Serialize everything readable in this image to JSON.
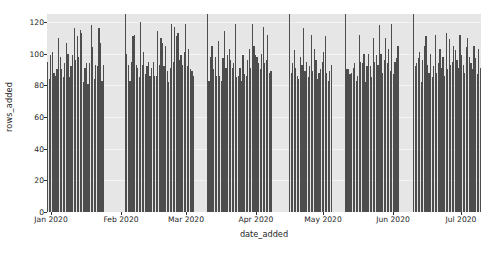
{
  "chart_data": {
    "type": "bar",
    "title": "",
    "xlabel": "date_added",
    "ylabel": "rows_added",
    "ylim": [
      0,
      125
    ],
    "yticks": [
      0,
      20,
      40,
      60,
      80,
      100,
      120
    ],
    "ytick_labels": [
      "0",
      "20",
      "40",
      "60",
      "80",
      "100",
      "120"
    ],
    "xtick_labels": [
      "Jan 2020",
      "Feb 2020",
      "Mar 2020",
      "Apr 2020",
      "May 2020",
      "Jun 2020",
      "Jul 2020"
    ],
    "xtick_positions_px": [
      51,
      121,
      186,
      256,
      323,
      393,
      461
    ],
    "grid": true,
    "grid_axis": "y",
    "bar_color": "#4d4d4d",
    "plot_background": "#e6e6e6",
    "figure_background": "#ffffff",
    "x_start": "2020-01-01",
    "x_end": "2020-07-28",
    "x_unit": "day",
    "note_clipped": "Several bars exceed the top of the axis and are clipped at 125.",
    "values": [
      95,
      84,
      99,
      101,
      88,
      86,
      90,
      110,
      98,
      90,
      85,
      94,
      107,
      100,
      85,
      92,
      99,
      116,
      96,
      111,
      98,
      115,
      113,
      82,
      91,
      94,
      81,
      94,
      118,
      104,
      84,
      93,
      92,
      116,
      107,
      83,
      93,
      null,
      null,
      null,
      null,
      null,
      null,
      null,
      null,
      null,
      null,
      null,
      null,
      null,
      126,
      100,
      93,
      83,
      95,
      111,
      112,
      93,
      91,
      85,
      120,
      93,
      101,
      87,
      92,
      95,
      86,
      91,
      95,
      86,
      86,
      114,
      93,
      110,
      107,
      92,
      105,
      89,
      82,
      91,
      119,
      95,
      117,
      111,
      113,
      96,
      99,
      93,
      101,
      119,
      92,
      103,
      90,
      89,
      86,
      null,
      null,
      null,
      null,
      null,
      null,
      null,
      null,
      126,
      83,
      98,
      105,
      90,
      98,
      86,
      108,
      86,
      83,
      97,
      114,
      91,
      99,
      103,
      96,
      91,
      94,
      119,
      85,
      86,
      91,
      83,
      99,
      87,
      86,
      96,
      103,
      91,
      119,
      105,
      99,
      98,
      94,
      90,
      100,
      117,
      94,
      96,
      112,
      88,
      89,
      null,
      null,
      null,
      null,
      null,
      null,
      null,
      null,
      null,
      null,
      null,
      126,
      88,
      94,
      102,
      91,
      86,
      84,
      98,
      93,
      116,
      89,
      95,
      85,
      92,
      112,
      89,
      103,
      96,
      84,
      88,
      90,
      95,
      101,
      111,
      88,
      83,
      89,
      93,
      null,
      null,
      null,
      null,
      null,
      null,
      null,
      null,
      126,
      90,
      90,
      87,
      88,
      91,
      94,
      83,
      86,
      112,
      95,
      94,
      100,
      82,
      92,
      100,
      92,
      85,
      110,
      95,
      99,
      93,
      118,
      100,
      88,
      96,
      110,
      94,
      103,
      89,
      119,
      87,
      95,
      97,
      105,
      null,
      null,
      null,
      null,
      null,
      null,
      null,
      null,
      null,
      126,
      92,
      94,
      97,
      101,
      82,
      96,
      105,
      111,
      93,
      88,
      100,
      85,
      92,
      112,
      88,
      94,
      103,
      91,
      98,
      86,
      113,
      90,
      109,
      93,
      95,
      105,
      102,
      96,
      91,
      112,
      99,
      93,
      88,
      104,
      110,
      98,
      94,
      90,
      105,
      97,
      87,
      103,
      91
    ]
  },
  "axes": {
    "ylabel_text": "rows_added",
    "xlabel_text": "date_added"
  }
}
